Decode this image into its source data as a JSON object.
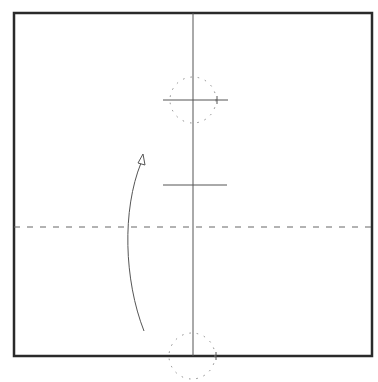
{
  "diagram": {
    "type": "origami-fold-diagram",
    "colors": {
      "paper_border": "#2a2a2a",
      "fold_line": "#555555",
      "guide_line": "#666666",
      "dotted_circle": "#888888",
      "arrow": "#555555",
      "background": "#ffffff"
    },
    "paper_square": {
      "x": 14,
      "y": 13,
      "width": 358,
      "height": 343
    },
    "center_vertical_line": {
      "x": 193,
      "y1": 13,
      "y2": 356
    },
    "valley_fold_dashed_line": {
      "y": 227,
      "x1": 14,
      "x2": 372
    },
    "top_marker": {
      "cx": 193,
      "cy": 100,
      "r": 23,
      "tick_x1": 163,
      "tick_x2": 228
    },
    "middle_mark": {
      "y": 185,
      "x1": 163,
      "x2": 227
    },
    "bottom_marker": {
      "cx": 192,
      "cy": 356,
      "r": 23
    },
    "fold_arrow": {
      "start": [
        144,
        331
      ],
      "end": [
        143,
        155
      ],
      "direction": "up"
    }
  }
}
